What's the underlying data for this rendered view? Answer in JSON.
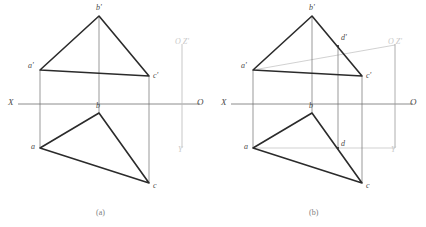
{
  "figure": {
    "title": "",
    "captions": [
      {
        "id": "cap-a",
        "text": "(a)",
        "x": 96,
        "y": 208
      },
      {
        "id": "cap-b",
        "text": "(b)",
        "x": 309,
        "y": 208
      }
    ],
    "colors": {
      "solid_line": "#2b2b2b",
      "thin_line": "#6e6e6e",
      "construction_line": "#cccccc",
      "label_text": "#4a4a4a",
      "faint_label_text": "#c9c9c9",
      "caption_text": "#7d7d7d",
      "background": "#ffffff"
    },
    "panels": [
      {
        "id": "panel-a",
        "caption": "(a)",
        "axis": {
          "label_left": "X",
          "label_right": "O",
          "y": 104,
          "x_start": 18,
          "x_end": 200
        },
        "profile_axis": {
          "x": 182,
          "top_label": "O Z'",
          "bottom_label": "Y",
          "y_top": 44,
          "y_bottom": 148
        },
        "points": [
          {
            "name": "a'",
            "x": 40,
            "y": 70
          },
          {
            "name": "b'",
            "x": 99,
            "y": 16
          },
          {
            "name": "c'",
            "x": 149,
            "y": 76
          },
          {
            "name": "a",
            "x": 40,
            "y": 148
          },
          {
            "name": "b",
            "x": 99,
            "y": 113
          },
          {
            "name": "c",
            "x": 149,
            "y": 183
          }
        ],
        "labels": [
          {
            "text": "a'",
            "x": 28,
            "y": 65
          },
          {
            "text": "b'",
            "x": 96,
            "y": 6
          },
          {
            "text": "c'",
            "x": 153,
            "y": 73
          },
          {
            "text": "a",
            "x": 31,
            "y": 145
          },
          {
            "text": "b",
            "x": 96,
            "y": 102
          },
          {
            "text": "c",
            "x": 153,
            "y": 183
          }
        ]
      },
      {
        "id": "panel-b",
        "caption": "(b)",
        "axis": {
          "label_left": "X",
          "label_right": "O",
          "y": 104,
          "x_start": 231,
          "x_end": 413
        },
        "profile_axis": {
          "x": 395,
          "top_label": "O Z'",
          "bottom_label": "Y",
          "y_top": 44,
          "y_bottom": 148
        },
        "points": [
          {
            "name": "a'",
            "x": 253,
            "y": 70
          },
          {
            "name": "b'",
            "x": 312,
            "y": 16
          },
          {
            "name": "c'",
            "x": 362,
            "y": 76
          },
          {
            "name": "d'",
            "x": 338,
            "y": 46
          },
          {
            "name": "a",
            "x": 253,
            "y": 148
          },
          {
            "name": "b",
            "x": 312,
            "y": 113
          },
          {
            "name": "c",
            "x": 362,
            "y": 183
          },
          {
            "name": "d",
            "x": 338,
            "y": 148
          }
        ],
        "labels": [
          {
            "text": "a'",
            "x": 241,
            "y": 65
          },
          {
            "text": "b'",
            "x": 309,
            "y": 6
          },
          {
            "text": "c'",
            "x": 366,
            "y": 73
          },
          {
            "text": "d'",
            "x": 341,
            "y": 37
          },
          {
            "text": "a",
            "x": 244,
            "y": 145
          },
          {
            "text": "b",
            "x": 309,
            "y": 102
          },
          {
            "text": "c",
            "x": 366,
            "y": 183
          },
          {
            "text": "d",
            "x": 341,
            "y": 141
          }
        ]
      }
    ],
    "notes": {
      "panel_a_description": "Front view triangle a'b'c' above XO axis, top view triangle abc below, joined by vertical projection lines.",
      "panel_b_description": "Same projections with auxiliary construction: line a'-d'-extension to profile axis and a-d-extension, locating point D on edge b'c' / bc."
    }
  }
}
